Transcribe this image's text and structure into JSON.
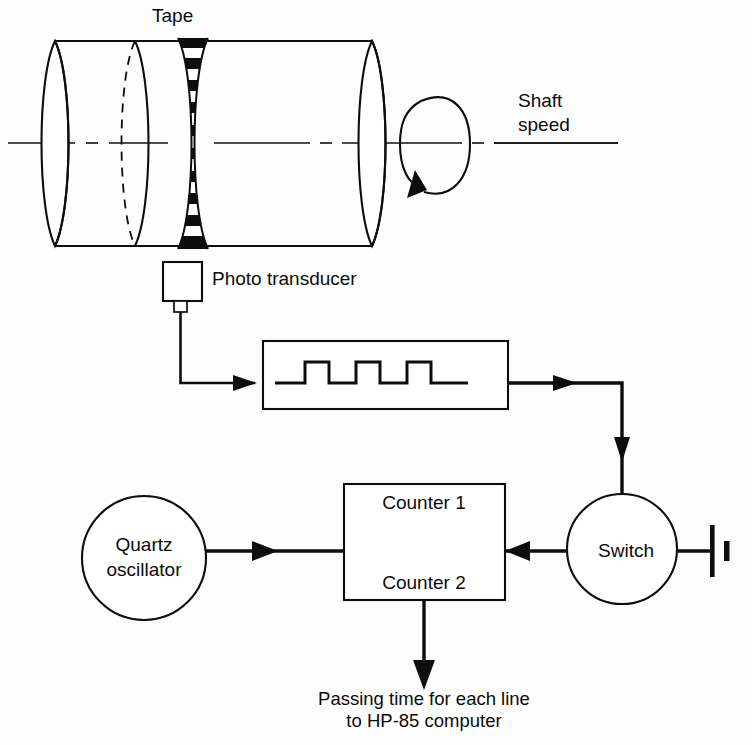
{
  "diagram": {
    "title_label": "Tape",
    "shaft_label_line1": "Shaft",
    "shaft_label_line2": "speed",
    "transducer_label": "Photo transducer",
    "oscillator_label_line1": "Quartz",
    "oscillator_label_line2": "oscillator",
    "counter_label_1": "Counter 1",
    "counter_label_2": "Counter 2",
    "switch_label": "Switch",
    "output_caption_line1": "Passing time for each line",
    "output_caption_line2": "to HP-85 computer",
    "colors": {
      "ink": "#0d0d0d",
      "paper": "#fdfdfd",
      "stripe_dark": "#0d0d0d",
      "stripe_light": "#ffffff"
    },
    "icons": {
      "rotation": "rotation-arrow-icon",
      "battery": "battery-cell-icon",
      "pulse": "square-wave-icon",
      "transducer": "photo-transducer-icon"
    },
    "pulse_train": {
      "pulse_count": 3,
      "description": "square wave"
    },
    "tape_band": {
      "stripe_count": 19,
      "description": "alternating black and white circumferential stripes"
    }
  }
}
